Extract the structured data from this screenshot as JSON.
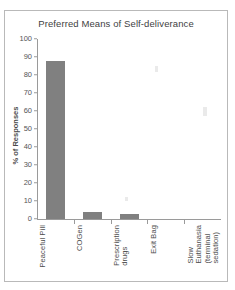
{
  "chart_data": {
    "type": "bar",
    "title": "Preferred Means of Self-deliverance",
    "xlabel": "",
    "ylabel": "% of Responses",
    "ylim": [
      0,
      100
    ],
    "yticks": [
      0,
      10,
      20,
      30,
      40,
      50,
      60,
      70,
      80,
      90,
      100
    ],
    "grid": false,
    "legend": false,
    "categories": [
      "Peaceful Pill",
      "COGen",
      "Prescription drugs",
      "Exit Bag",
      "Slow Euthanasia (terminal sedation)"
    ],
    "category_labels": [
      "Peaceful Pill",
      "COGen",
      "Prescription\ndrugs",
      "Exit Bag",
      "Slow\nEuthanasia\n(terminal\nsedation)"
    ],
    "values": [
      88,
      4,
      3,
      0,
      0
    ],
    "bar_color": "#808080",
    "axis_color": "#9a9a9a",
    "text_color": "#4d4d4d"
  }
}
